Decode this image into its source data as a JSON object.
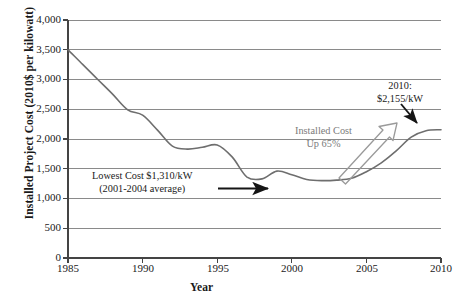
{
  "chart_data": {
    "type": "line",
    "title": "",
    "xlabel": "Year",
    "ylabel": "Installed Project Cost (2010$ per kilowatt)",
    "xlim": [
      1985,
      2010
    ],
    "ylim": [
      0,
      4000
    ],
    "xticks": [
      "1985",
      "1990",
      "1995",
      "2000",
      "2005",
      "2010"
    ],
    "yticks": [
      "0",
      "500",
      "1,000",
      "1,500",
      "2,000",
      "2,500",
      "3,000",
      "3,500",
      "4,000"
    ],
    "grid": "horizontal",
    "legend": "none",
    "series": [
      {
        "name": "Installed Project Cost",
        "color": "#6e6e6e",
        "x": [
          1985,
          1986,
          1987,
          1988,
          1989,
          1990,
          1991,
          1992,
          1993,
          1994,
          1995,
          1996,
          1997,
          1998,
          1999,
          2000,
          2001,
          2002,
          2003,
          2004,
          2005,
          2006,
          2007,
          2008,
          2009,
          2010
        ],
        "values": [
          3500,
          3250,
          3000,
          2750,
          2490,
          2400,
          2150,
          1880,
          1830,
          1860,
          1900,
          1700,
          1360,
          1330,
          1460,
          1400,
          1320,
          1300,
          1310,
          1340,
          1450,
          1600,
          1800,
          2030,
          2140,
          2155
        ]
      }
    ],
    "annotations": [
      {
        "name": "lowest-cost-note",
        "line1": "Lowest Cost $1,310/kW",
        "line2": "(2001-2004 average)",
        "color": "#1a1a1a",
        "arrow": "black-arrow-right"
      },
      {
        "name": "installed-cost-up-note",
        "line1": "Installed Cost",
        "line2": "Up 65%",
        "color": "#7b7b7b",
        "arrow": "gray-block-arrow-up-right"
      },
      {
        "name": "final-value-note",
        "line1": "2010:",
        "line2": "$2,155/kW",
        "color": "#1a1a1a",
        "arrow": "black-arrow-down-right"
      }
    ]
  },
  "colors": {
    "line": "#6e6e6e",
    "grid": "#8a8a8a",
    "axis": "#555555",
    "accent_gray": "#7b7b7b",
    "text": "#1a1a1a"
  }
}
